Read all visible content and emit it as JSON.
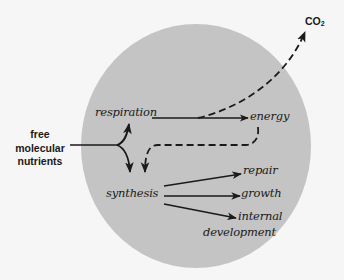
{
  "diagram": {
    "type": "metabolic flow diagram",
    "colors": {
      "background": "#f6f6f6",
      "cell_fill": "#c4c4c4",
      "ink": "#1a1a1a"
    },
    "cell": {
      "shape": "circle",
      "center": [
        196,
        146
      ],
      "radius_x": 115,
      "radius_y": 122
    },
    "input_label": {
      "lines": [
        "free",
        "molecular",
        "nutrients"
      ]
    },
    "nodes": {
      "respiration": "respiration",
      "energy": "energy",
      "synthesis": "synthesis",
      "repair": "repair",
      "growth": "growth",
      "internal_development_line1": "internal",
      "internal_development_line2": "development"
    },
    "output_gas": {
      "base": "CO",
      "subscript": "2"
    },
    "edges": [
      {
        "from": "free molecular nutrients",
        "to": "respiration",
        "style": "solid"
      },
      {
        "from": "free molecular nutrients",
        "to": "synthesis",
        "style": "solid"
      },
      {
        "from": "respiration",
        "to": "energy",
        "style": "solid"
      },
      {
        "from": "respiration",
        "to": "CO2",
        "style": "dashed"
      },
      {
        "from": "energy",
        "to": "synthesis",
        "style": "dashed"
      },
      {
        "from": "synthesis",
        "to": "repair",
        "style": "solid"
      },
      {
        "from": "synthesis",
        "to": "growth",
        "style": "solid"
      },
      {
        "from": "synthesis",
        "to": "internal development",
        "style": "solid"
      }
    ]
  }
}
